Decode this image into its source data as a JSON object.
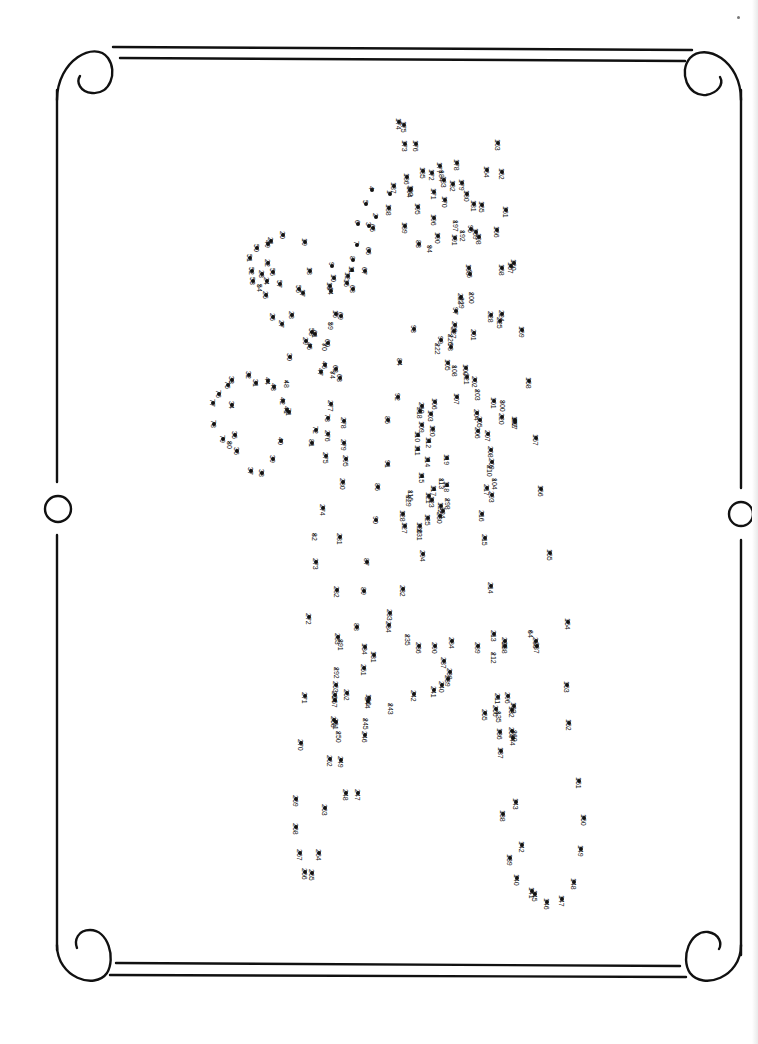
{
  "page": {
    "type": "connect-the-dots puzzle",
    "orientation": "rotated 90 degrees clockwise",
    "ink_color": "#111111",
    "background": "#ffffff"
  },
  "border": {
    "style": "double rule with scroll corners and circle mid-marks",
    "corners": [
      "top-left scroll",
      "top-right scroll",
      "bottom-left scroll",
      "bottom-right scroll"
    ],
    "side_marks": [
      "left circle",
      "right circle"
    ]
  },
  "dots": [
    {
      "n": "174",
      "x": 399,
      "y": 122
    },
    {
      "n": "175",
      "x": 404,
      "y": 125
    },
    {
      "n": "176",
      "x": 416,
      "y": 144
    },
    {
      "n": "173",
      "x": 405,
      "y": 144
    },
    {
      "n": "163",
      "x": 498,
      "y": 143
    },
    {
      "n": "162",
      "x": 502,
      "y": 172
    },
    {
      "n": "164",
      "x": 487,
      "y": 170
    },
    {
      "n": "178",
      "x": 457,
      "y": 163
    },
    {
      "n": "177",
      "x": 440,
      "y": 166
    },
    {
      "n": "172",
      "x": 432,
      "y": 173
    },
    {
      "n": "185",
      "x": 423,
      "y": 171
    },
    {
      "n": "184",
      "x": 442,
      "y": 174
    },
    {
      "n": "183",
      "x": 444,
      "y": 180
    },
    {
      "n": "179",
      "x": 462,
      "y": 183
    },
    {
      "n": "182",
      "x": 453,
      "y": 184
    },
    {
      "n": "186",
      "x": 407,
      "y": 177
    },
    {
      "n": "187",
      "x": 394,
      "y": 186
    },
    {
      "n": "171",
      "x": 434,
      "y": 192
    },
    {
      "n": "193",
      "x": 411,
      "y": 189
    },
    {
      "n": "194",
      "x": 410,
      "y": 190
    },
    {
      "n": "170",
      "x": 445,
      "y": 200
    },
    {
      "n": "180",
      "x": 467,
      "y": 194
    },
    {
      "n": "165",
      "x": 482,
      "y": 205
    },
    {
      "n": "181",
      "x": 474,
      "y": 204
    },
    {
      "n": "161",
      "x": 506,
      "y": 210
    },
    {
      "n": "4",
      "x": 372,
      "y": 190
    },
    {
      "n": "1",
      "x": 390,
      "y": 194
    },
    {
      "n": "5",
      "x": 366,
      "y": 204
    },
    {
      "n": "195",
      "x": 418,
      "y": 207
    },
    {
      "n": "188",
      "x": 389,
      "y": 208
    },
    {
      "n": "2",
      "x": 376,
      "y": 217
    },
    {
      "n": "3",
      "x": 369,
      "y": 226
    },
    {
      "n": "6",
      "x": 358,
      "y": 224
    },
    {
      "n": "196",
      "x": 434,
      "y": 218
    },
    {
      "n": "197",
      "x": 456,
      "y": 224
    },
    {
      "n": "189",
      "x": 405,
      "y": 226
    },
    {
      "n": "65",
      "x": 373,
      "y": 228
    },
    {
      "n": "95",
      "x": 471,
      "y": 229
    },
    {
      "n": "169",
      "x": 476,
      "y": 232
    },
    {
      "n": "192",
      "x": 463,
      "y": 234
    },
    {
      "n": "166",
      "x": 497,
      "y": 230
    },
    {
      "n": "190",
      "x": 438,
      "y": 236
    },
    {
      "n": "191",
      "x": 455,
      "y": 238
    },
    {
      "n": "198",
      "x": 479,
      "y": 237
    },
    {
      "n": "83",
      "x": 419,
      "y": 244
    },
    {
      "n": "94",
      "x": 430,
      "y": 249
    },
    {
      "n": "7",
      "x": 357,
      "y": 245
    },
    {
      "n": "66",
      "x": 369,
      "y": 251
    },
    {
      "n": "160",
      "x": 514,
      "y": 263
    },
    {
      "n": "167",
      "x": 511,
      "y": 266
    },
    {
      "n": "168",
      "x": 502,
      "y": 268
    },
    {
      "n": "199",
      "x": 469,
      "y": 268
    },
    {
      "n": "20",
      "x": 283,
      "y": 235
    },
    {
      "n": "21",
      "x": 271,
      "y": 241
    },
    {
      "n": "49",
      "x": 268,
      "y": 244
    },
    {
      "n": "50",
      "x": 257,
      "y": 248
    },
    {
      "n": "19",
      "x": 305,
      "y": 242
    },
    {
      "n": "8",
      "x": 353,
      "y": 260
    },
    {
      "n": "9",
      "x": 332,
      "y": 266
    },
    {
      "n": "67",
      "x": 365,
      "y": 271
    },
    {
      "n": "11",
      "x": 352,
      "y": 270
    },
    {
      "n": "12",
      "x": 348,
      "y": 276
    },
    {
      "n": "10",
      "x": 334,
      "y": 278
    },
    {
      "n": "15",
      "x": 347,
      "y": 283
    },
    {
      "n": "13",
      "x": 330,
      "y": 286
    },
    {
      "n": "14",
      "x": 331,
      "y": 291
    },
    {
      "n": "68",
      "x": 353,
      "y": 289
    },
    {
      "n": "51",
      "x": 250,
      "y": 258
    },
    {
      "n": "22",
      "x": 268,
      "y": 263
    },
    {
      "n": "56",
      "x": 273,
      "y": 272
    },
    {
      "n": "52",
      "x": 252,
      "y": 271
    },
    {
      "n": "23",
      "x": 262,
      "y": 274
    },
    {
      "n": "18",
      "x": 310,
      "y": 271
    },
    {
      "n": "53",
      "x": 253,
      "y": 281
    },
    {
      "n": "24",
      "x": 267,
      "y": 281
    },
    {
      "n": "54",
      "x": 260,
      "y": 288
    },
    {
      "n": "57",
      "x": 280,
      "y": 284
    },
    {
      "n": "55",
      "x": 299,
      "y": 289
    },
    {
      "n": "17",
      "x": 303,
      "y": 293
    },
    {
      "n": "25",
      "x": 266,
      "y": 295
    },
    {
      "n": "28",
      "x": 292,
      "y": 315
    },
    {
      "n": "26",
      "x": 273,
      "y": 317
    },
    {
      "n": "27",
      "x": 282,
      "y": 324
    },
    {
      "n": "16",
      "x": 336,
      "y": 314
    },
    {
      "n": "69",
      "x": 341,
      "y": 316
    },
    {
      "n": "59",
      "x": 331,
      "y": 326
    },
    {
      "n": "58",
      "x": 312,
      "y": 332
    },
    {
      "n": "61",
      "x": 315,
      "y": 334
    },
    {
      "n": "60",
      "x": 328,
      "y": 343
    },
    {
      "n": "29",
      "x": 306,
      "y": 341
    },
    {
      "n": "45",
      "x": 310,
      "y": 346
    },
    {
      "n": "70",
      "x": 325,
      "y": 347
    },
    {
      "n": "30",
      "x": 290,
      "y": 357
    },
    {
      "n": "46",
      "x": 325,
      "y": 365
    },
    {
      "n": "62",
      "x": 336,
      "y": 369
    },
    {
      "n": "47",
      "x": 321,
      "y": 372
    },
    {
      "n": "74",
      "x": 333,
      "y": 375
    },
    {
      "n": "63",
      "x": 340,
      "y": 378
    },
    {
      "n": "32",
      "x": 249,
      "y": 375
    },
    {
      "n": "33",
      "x": 232,
      "y": 380
    },
    {
      "n": "31",
      "x": 256,
      "y": 383
    },
    {
      "n": "44",
      "x": 268,
      "y": 381
    },
    {
      "n": "48",
      "x": 287,
      "y": 384
    },
    {
      "n": "75",
      "x": 228,
      "y": 385
    },
    {
      "n": "43",
      "x": 274,
      "y": 387
    },
    {
      "n": "76",
      "x": 219,
      "y": 394
    },
    {
      "n": "42",
      "x": 283,
      "y": 401
    },
    {
      "n": "34",
      "x": 232,
      "y": 405
    },
    {
      "n": "77",
      "x": 213,
      "y": 403
    },
    {
      "n": "41",
      "x": 287,
      "y": 410
    },
    {
      "n": "71",
      "x": 289,
      "y": 412
    },
    {
      "n": "78",
      "x": 214,
      "y": 424
    },
    {
      "n": "35",
      "x": 235,
      "y": 435
    },
    {
      "n": "79",
      "x": 223,
      "y": 439
    },
    {
      "n": "80",
      "x": 230,
      "y": 445
    },
    {
      "n": "40",
      "x": 281,
      "y": 441
    },
    {
      "n": "36",
      "x": 237,
      "y": 451
    },
    {
      "n": "39",
      "x": 273,
      "y": 459
    },
    {
      "n": "37",
      "x": 251,
      "y": 471
    },
    {
      "n": "38",
      "x": 262,
      "y": 473
    },
    {
      "n": "96",
      "x": 470,
      "y": 274
    },
    {
      "n": "200",
      "x": 472,
      "y": 296
    },
    {
      "n": "223",
      "x": 461,
      "y": 297
    },
    {
      "n": "229",
      "x": 462,
      "y": 301
    },
    {
      "n": "224",
      "x": 502,
      "y": 314
    },
    {
      "n": "228",
      "x": 491,
      "y": 315
    },
    {
      "n": "225",
      "x": 500,
      "y": 321
    },
    {
      "n": "97",
      "x": 456,
      "y": 311
    },
    {
      "n": "93",
      "x": 414,
      "y": 329
    },
    {
      "n": "299",
      "x": 455,
      "y": 325
    },
    {
      "n": "227",
      "x": 454,
      "y": 331
    },
    {
      "n": "201",
      "x": 474,
      "y": 333
    },
    {
      "n": "159",
      "x": 522,
      "y": 330
    },
    {
      "n": "99",
      "x": 441,
      "y": 340
    },
    {
      "n": "226",
      "x": 451,
      "y": 338
    },
    {
      "n": "222",
      "x": 438,
      "y": 347
    },
    {
      "n": "98",
      "x": 451,
      "y": 347
    },
    {
      "n": "105",
      "x": 448,
      "y": 363
    },
    {
      "n": "100",
      "x": 466,
      "y": 368
    },
    {
      "n": "108",
      "x": 455,
      "y": 369
    },
    {
      "n": "202",
      "x": 475,
      "y": 380
    },
    {
      "n": "221",
      "x": 467,
      "y": 377
    },
    {
      "n": "158",
      "x": 529,
      "y": 381
    },
    {
      "n": "84",
      "x": 400,
      "y": 362
    },
    {
      "n": "203",
      "x": 478,
      "y": 393
    },
    {
      "n": "106",
      "x": 435,
      "y": 402
    },
    {
      "n": "107",
      "x": 457,
      "y": 397
    },
    {
      "n": "300",
      "x": 503,
      "y": 404
    },
    {
      "n": "101",
      "x": 494,
      "y": 401
    },
    {
      "n": "219",
      "x": 422,
      "y": 406
    },
    {
      "n": "218",
      "x": 420,
      "y": 411
    },
    {
      "n": "103",
      "x": 431,
      "y": 414
    },
    {
      "n": "204",
      "x": 477,
      "y": 413
    },
    {
      "n": "220",
      "x": 502,
      "y": 417
    },
    {
      "n": "182",
      "x": 515,
      "y": 420
    },
    {
      "n": "297",
      "x": 515,
      "y": 422
    },
    {
      "n": "205",
      "x": 480,
      "y": 420
    },
    {
      "n": "109",
      "x": 422,
      "y": 425
    },
    {
      "n": "120",
      "x": 433,
      "y": 429
    },
    {
      "n": "206",
      "x": 478,
      "y": 431
    },
    {
      "n": "207",
      "x": 488,
      "y": 434
    },
    {
      "n": "92",
      "x": 398,
      "y": 397
    },
    {
      "n": "85",
      "x": 388,
      "y": 420
    },
    {
      "n": "110",
      "x": 418,
      "y": 435
    },
    {
      "n": "112",
      "x": 429,
      "y": 441
    },
    {
      "n": "157",
      "x": 536,
      "y": 438
    },
    {
      "n": "208",
      "x": 491,
      "y": 450
    },
    {
      "n": "111",
      "x": 418,
      "y": 449
    },
    {
      "n": "119",
      "x": 447,
      "y": 458
    },
    {
      "n": "209",
      "x": 492,
      "y": 462
    },
    {
      "n": "210",
      "x": 490,
      "y": 469
    },
    {
      "n": "104",
      "x": 495,
      "y": 482
    },
    {
      "n": "91",
      "x": 388,
      "y": 464
    },
    {
      "n": "114",
      "x": 428,
      "y": 460
    },
    {
      "n": "113",
      "x": 442,
      "y": 482
    },
    {
      "n": "118",
      "x": 447,
      "y": 485
    },
    {
      "n": "115",
      "x": 422,
      "y": 476
    },
    {
      "n": "117",
      "x": 434,
      "y": 489
    },
    {
      "n": "217",
      "x": 487,
      "y": 488
    },
    {
      "n": "156",
      "x": 541,
      "y": 489
    },
    {
      "n": "116",
      "x": 411,
      "y": 494
    },
    {
      "n": "129",
      "x": 409,
      "y": 499
    },
    {
      "n": "121",
      "x": 429,
      "y": 496
    },
    {
      "n": "123",
      "x": 432,
      "y": 500
    },
    {
      "n": "298",
      "x": 448,
      "y": 502
    },
    {
      "n": "293",
      "x": 492,
      "y": 495
    },
    {
      "n": "86",
      "x": 378,
      "y": 487
    },
    {
      "n": "124",
      "x": 443,
      "y": 511
    },
    {
      "n": "122",
      "x": 441,
      "y": 506
    },
    {
      "n": "230",
      "x": 440,
      "y": 516
    },
    {
      "n": "128",
      "x": 403,
      "y": 514
    },
    {
      "n": "125",
      "x": 428,
      "y": 518
    },
    {
      "n": "216",
      "x": 482,
      "y": 514
    },
    {
      "n": "90",
      "x": 376,
      "y": 520
    },
    {
      "n": "127",
      "x": 405,
      "y": 526
    },
    {
      "n": "126",
      "x": 420,
      "y": 526
    },
    {
      "n": "231",
      "x": 420,
      "y": 533
    },
    {
      "n": "294",
      "x": 423,
      "y": 554
    },
    {
      "n": "215",
      "x": 485,
      "y": 538
    },
    {
      "n": "155",
      "x": 550,
      "y": 553
    },
    {
      "n": "81",
      "x": 312,
      "y": 443
    },
    {
      "n": "277",
      "x": 331,
      "y": 404
    },
    {
      "n": "73",
      "x": 328,
      "y": 418
    },
    {
      "n": "278",
      "x": 344,
      "y": 421
    },
    {
      "n": "72",
      "x": 316,
      "y": 430
    },
    {
      "n": "276",
      "x": 328,
      "y": 434
    },
    {
      "n": "279",
      "x": 344,
      "y": 443
    },
    {
      "n": "275",
      "x": 326,
      "y": 456
    },
    {
      "n": "295",
      "x": 346,
      "y": 459
    },
    {
      "n": "280",
      "x": 343,
      "y": 482
    },
    {
      "n": "274",
      "x": 323,
      "y": 508
    },
    {
      "n": "82",
      "x": 315,
      "y": 537
    },
    {
      "n": "281",
      "x": 340,
      "y": 537
    },
    {
      "n": "273",
      "x": 316,
      "y": 562
    },
    {
      "n": "87",
      "x": 367,
      "y": 562
    },
    {
      "n": "232",
      "x": 403,
      "y": 589
    },
    {
      "n": "282",
      "x": 337,
      "y": 590
    },
    {
      "n": "89",
      "x": 364,
      "y": 591
    },
    {
      "n": "233",
      "x": 390,
      "y": 613
    },
    {
      "n": "272",
      "x": 309,
      "y": 617
    },
    {
      "n": "214",
      "x": 491,
      "y": 586
    },
    {
      "n": "154",
      "x": 568,
      "y": 622
    },
    {
      "n": "88",
      "x": 357,
      "y": 627
    },
    {
      "n": "234",
      "x": 389,
      "y": 625
    },
    {
      "n": "283",
      "x": 338,
      "y": 637
    },
    {
      "n": "134",
      "x": 365,
      "y": 647
    },
    {
      "n": "235",
      "x": 408,
      "y": 638
    },
    {
      "n": "236",
      "x": 419,
      "y": 646
    },
    {
      "n": "290",
      "x": 435,
      "y": 646
    },
    {
      "n": "284",
      "x": 452,
      "y": 641
    },
    {
      "n": "289",
      "x": 478,
      "y": 646
    },
    {
      "n": "213",
      "x": 494,
      "y": 634
    },
    {
      "n": "285",
      "x": 505,
      "y": 641
    },
    {
      "n": "64",
      "x": 531,
      "y": 634
    },
    {
      "n": "286",
      "x": 536,
      "y": 641
    },
    {
      "n": "287",
      "x": 537,
      "y": 646
    },
    {
      "n": "291",
      "x": 341,
      "y": 643
    },
    {
      "n": "131",
      "x": 374,
      "y": 655
    },
    {
      "n": "237",
      "x": 444,
      "y": 661
    },
    {
      "n": "238",
      "x": 450,
      "y": 672
    },
    {
      "n": "212",
      "x": 494,
      "y": 656
    },
    {
      "n": "288",
      "x": 505,
      "y": 646
    },
    {
      "n": "292",
      "x": 337,
      "y": 671
    },
    {
      "n": "251",
      "x": 364,
      "y": 668
    },
    {
      "n": "239",
      "x": 448,
      "y": 679
    },
    {
      "n": "240",
      "x": 442,
      "y": 685
    },
    {
      "n": "153",
      "x": 567,
      "y": 685
    },
    {
      "n": "253",
      "x": 336,
      "y": 685
    },
    {
      "n": "254",
      "x": 335,
      "y": 695
    },
    {
      "n": "252",
      "x": 347,
      "y": 693
    },
    {
      "n": "130",
      "x": 369,
      "y": 698
    },
    {
      "n": "242",
      "x": 414,
      "y": 694
    },
    {
      "n": "241",
      "x": 434,
      "y": 690
    },
    {
      "n": "211",
      "x": 498,
      "y": 697
    },
    {
      "n": "296",
      "x": 508,
      "y": 696
    },
    {
      "n": "255",
      "x": 485,
      "y": 713
    },
    {
      "n": "133",
      "x": 514,
      "y": 706
    },
    {
      "n": "271",
      "x": 305,
      "y": 696
    },
    {
      "n": "257",
      "x": 335,
      "y": 700
    },
    {
      "n": "244",
      "x": 368,
      "y": 701
    },
    {
      "n": "243",
      "x": 391,
      "y": 707
    },
    {
      "n": "256",
      "x": 496,
      "y": 709
    },
    {
      "n": "135",
      "x": 499,
      "y": 715
    },
    {
      "n": "132",
      "x": 512,
      "y": 710
    },
    {
      "n": "258",
      "x": 334,
      "y": 720
    },
    {
      "n": "261",
      "x": 336,
      "y": 722
    },
    {
      "n": "245",
      "x": 366,
      "y": 722
    },
    {
      "n": "136",
      "x": 500,
      "y": 732
    },
    {
      "n": "259",
      "x": 512,
      "y": 731
    },
    {
      "n": "260",
      "x": 515,
      "y": 734
    },
    {
      "n": "144",
      "x": 513,
      "y": 738
    },
    {
      "n": "152",
      "x": 569,
      "y": 723
    },
    {
      "n": "250",
      "x": 339,
      "y": 735
    },
    {
      "n": "246",
      "x": 365,
      "y": 735
    },
    {
      "n": "270",
      "x": 301,
      "y": 743
    },
    {
      "n": "262",
      "x": 330,
      "y": 759
    },
    {
      "n": "249",
      "x": 341,
      "y": 760
    },
    {
      "n": "137",
      "x": 501,
      "y": 751
    },
    {
      "n": "151",
      "x": 579,
      "y": 781
    },
    {
      "n": "247",
      "x": 358,
      "y": 793
    },
    {
      "n": "248",
      "x": 346,
      "y": 793
    },
    {
      "n": "269",
      "x": 296,
      "y": 799
    },
    {
      "n": "143",
      "x": 516,
      "y": 802
    },
    {
      "n": "263",
      "x": 325,
      "y": 808
    },
    {
      "n": "138",
      "x": 503,
      "y": 814
    },
    {
      "n": "150",
      "x": 584,
      "y": 818
    },
    {
      "n": "268",
      "x": 296,
      "y": 827
    },
    {
      "n": "142",
      "x": 522,
      "y": 845
    },
    {
      "n": "264",
      "x": 319,
      "y": 853
    },
    {
      "n": "149",
      "x": 581,
      "y": 849
    },
    {
      "n": "267",
      "x": 300,
      "y": 853
    },
    {
      "n": "139",
      "x": 510,
      "y": 858
    },
    {
      "n": "140",
      "x": 517,
      "y": 878
    },
    {
      "n": "148",
      "x": 574,
      "y": 882
    },
    {
      "n": "266",
      "x": 305,
      "y": 872
    },
    {
      "n": "265",
      "x": 312,
      "y": 873
    },
    {
      "n": "141",
      "x": 532,
      "y": 891
    },
    {
      "n": "145",
      "x": 535,
      "y": 894
    },
    {
      "n": "147",
      "x": 562,
      "y": 899
    },
    {
      "n": "146",
      "x": 547,
      "y": 902
    }
  ]
}
